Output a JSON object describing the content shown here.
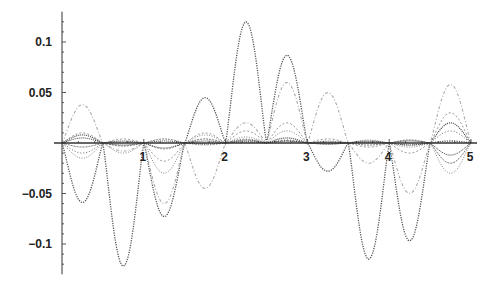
{
  "chart_data": {
    "type": "line",
    "title": "",
    "xlabel": "",
    "ylabel": "",
    "xlim": [
      0,
      5
    ],
    "ylim": [
      -0.13,
      0.13
    ],
    "grid": false,
    "legend": null,
    "x_ticks": [
      "1",
      "2",
      "3",
      "4",
      "5"
    ],
    "y_ticks": [
      "0.1",
      "0.05",
      "-0.05",
      "-0.1"
    ],
    "y_tick_values": [
      0.1,
      0.05,
      -0.05,
      -0.1
    ],
    "x_tick_values": [
      1,
      2,
      3,
      4,
      5
    ],
    "segment_nodes": [
      0,
      0.5,
      1,
      1.5,
      2,
      2.5,
      3,
      3.5,
      4,
      4.5,
      5
    ],
    "series": [
      {
        "name": "series-1",
        "color": "#555555",
        "dash": "1.2,1.2",
        "width": 1.3,
        "values": [
          -0.059,
          -0.122,
          -0.073,
          0.045,
          0.12,
          0.087,
          -0.028,
          -0.115,
          -0.097,
          0.002
        ]
      },
      {
        "name": "series-2",
        "color": "#aaaaaa",
        "dash": "3,2,1,2",
        "width": 1.1,
        "values": [
          0.038,
          -0.008,
          -0.06,
          -0.045,
          0.02,
          0.06,
          0.05,
          -0.02,
          -0.05,
          0.058
        ]
      },
      {
        "name": "series-3",
        "color": "#999999",
        "dash": "2,2",
        "width": 1.0,
        "values": [
          0.01,
          0.004,
          -0.018,
          0.01,
          0.012,
          0.02,
          0.004,
          -0.004,
          -0.01,
          0.03
        ]
      },
      {
        "name": "series-4",
        "color": "#888888",
        "dash": "1,1.5",
        "width": 1.0,
        "values": [
          -0.015,
          -0.01,
          -0.03,
          0.008,
          0.006,
          0.012,
          0.002,
          0.003,
          -0.004,
          -0.03
        ]
      },
      {
        "name": "series-5",
        "color": "#444444",
        "dash": "1,1",
        "width": 1.2,
        "values": [
          0.008,
          0.002,
          -0.005,
          0.002,
          0.003,
          0.005,
          0.001,
          0.002,
          -0.002,
          0.02
        ]
      },
      {
        "name": "series-6",
        "color": "#777777",
        "dash": "2,1",
        "width": 1.0,
        "values": [
          -0.004,
          -0.003,
          0.004,
          0.004,
          0.002,
          0.002,
          -0.001,
          -0.002,
          0.003,
          -0.02
        ]
      },
      {
        "name": "series-7",
        "color": "#666666",
        "dash": "1,2",
        "width": 1.0,
        "values": [
          -0.01,
          0.001,
          -0.006,
          -0.002,
          0.004,
          0.003,
          0.001,
          0.001,
          -0.002,
          0.012
        ]
      },
      {
        "name": "series-8",
        "color": "#333333",
        "dash": "1,1",
        "width": 1.0,
        "values": [
          0.005,
          -0.002,
          0.002,
          -0.001,
          0.001,
          0.002,
          -0.001,
          0.001,
          0.002,
          -0.012
        ]
      }
    ]
  },
  "layout": {
    "origin_x": 62,
    "origin_y": 143,
    "px_per_x_unit": 81.8,
    "px_per_y_unit": 1010,
    "axis_color": "#333333"
  }
}
